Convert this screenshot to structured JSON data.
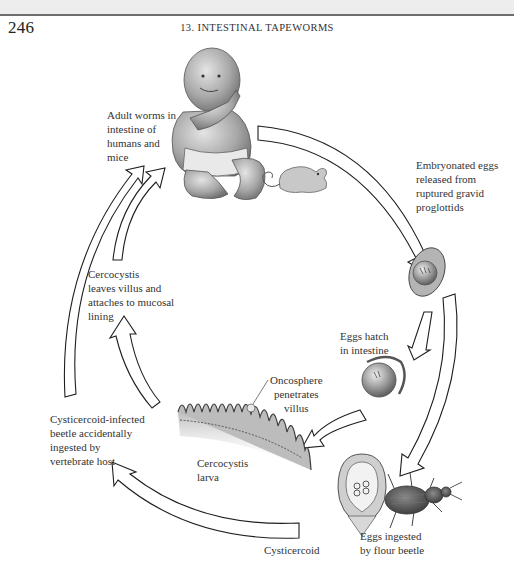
{
  "header": {
    "page_number": "246",
    "running_head": "13. INTESTINAL TAPEWORMS"
  },
  "diagram": {
    "stages": [
      {
        "id": "adult",
        "label": "Adult worms in\nintestine of\nhumans and\nmice",
        "icon": "human-infant-and-mouse-illustration"
      },
      {
        "id": "eggs-released",
        "label": "Embryonated eggs\nreleased from\nruptured gravid\nproglottids",
        "icon": "embryonated-egg-illustration"
      },
      {
        "id": "eggs-hatch",
        "label": "Eggs hatch\nin intestine",
        "icon": "hatching-egg-illustration"
      },
      {
        "id": "oncosphere",
        "label": "Oncosphere\npenetrates\nvillus",
        "icon": "intestinal-villi-illustration"
      },
      {
        "id": "cercocystis-larva",
        "label": "Cercocystis\nlarva",
        "icon": ""
      },
      {
        "id": "cercocystis-leaves",
        "label": "Cercocystis\nleaves villus and\nattaches to mucosal\nlining",
        "icon": ""
      },
      {
        "id": "eggs-ingested",
        "label": "Eggs ingested\nby flour beetle",
        "icon": "flour-beetle-illustration"
      },
      {
        "id": "cysticercoid",
        "label": "Cysticercoid",
        "icon": "cysticercoid-illustration"
      },
      {
        "id": "beetle-ingested",
        "label": "Cysticercoid-infected\nbeetle accidentally\ningested by\nvertebrate host",
        "icon": ""
      }
    ]
  },
  "colors": {
    "background": "#ffffff",
    "top_band": "#ededed",
    "arrow_stroke": "#1e1e1e",
    "illustration_gray": "#9a9a9a",
    "text": "#333333"
  }
}
